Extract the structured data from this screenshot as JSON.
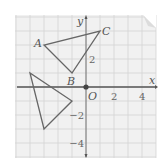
{
  "diagram": {
    "type": "coordinate-plane",
    "grid": {
      "x_range": [
        -5,
        5
      ],
      "y_range": [
        -5,
        5
      ],
      "unit_px": 14,
      "origin_px": [
        86,
        87
      ],
      "background": "#f1f1f1",
      "gridline_color": "#d4d4d4",
      "axis_color": "#555555"
    },
    "axes": {
      "x_label": "x",
      "y_label": "y",
      "origin_label": "O",
      "x_ticks": [
        {
          "value": 2,
          "label": "2"
        },
        {
          "value": 4,
          "label": "4"
        }
      ],
      "y_ticks": [
        {
          "value": 2,
          "label": "2"
        },
        {
          "value": -2,
          "label": "−2"
        },
        {
          "value": -4,
          "label": "−4"
        }
      ]
    },
    "triangle_abc": {
      "stroke": "#666666",
      "vertices": [
        {
          "name": "A",
          "x": -3,
          "y": 3,
          "label": "A"
        },
        {
          "name": "B",
          "x": -1,
          "y": 1,
          "label": "B"
        },
        {
          "name": "C",
          "x": 1,
          "y": 4,
          "label": "C"
        }
      ]
    },
    "triangle_image": {
      "stroke": "#666666",
      "vertices": [
        {
          "x": -3,
          "y": -3
        },
        {
          "x": -1,
          "y": -1
        },
        {
          "x": -4,
          "y": 1
        }
      ]
    }
  }
}
